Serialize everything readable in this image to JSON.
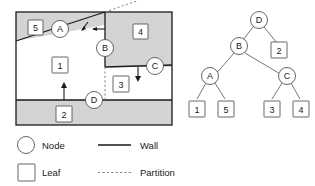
{
  "figure": {
    "colors": {
      "region_fill_gray": "#d4d4d4",
      "region_fill_white": "#ffffff",
      "wall_stroke": "#1a1a1a",
      "partition_stroke": "#777777",
      "shape_stroke": "#555555",
      "text": "#1a1a1a",
      "background": "#ffffff"
    }
  },
  "map": {
    "name": "partitioned-floorplan",
    "regions": [
      {
        "id": "region-5",
        "label": "5",
        "fill": "gray"
      },
      {
        "id": "region-4",
        "label": "4",
        "fill": "gray"
      },
      {
        "id": "region-2",
        "label": "2",
        "fill": "gray"
      },
      {
        "id": "region-1",
        "label": "1",
        "fill": "white"
      },
      {
        "id": "region-3",
        "label": "3",
        "fill": "white"
      }
    ],
    "nodes": [
      {
        "id": "map-node-a",
        "label": "A"
      },
      {
        "id": "map-node-b",
        "label": "B"
      },
      {
        "id": "map-node-c",
        "label": "C"
      },
      {
        "id": "map-node-d",
        "label": "D"
      }
    ],
    "leaf_labels": [
      "5",
      "4",
      "1",
      "3",
      "2"
    ]
  },
  "tree": {
    "name": "bsp-tree",
    "root": "D",
    "nodes": [
      {
        "id": "tree-node-d",
        "label": "D",
        "type": "node"
      },
      {
        "id": "tree-node-b",
        "label": "B",
        "type": "node"
      },
      {
        "id": "tree-node-a",
        "label": "A",
        "type": "node"
      },
      {
        "id": "tree-node-c",
        "label": "C",
        "type": "node"
      }
    ],
    "leaves": [
      {
        "id": "tree-leaf-2",
        "label": "2",
        "parent": "D"
      },
      {
        "id": "tree-leaf-1",
        "label": "1",
        "parent": "A"
      },
      {
        "id": "tree-leaf-5",
        "label": "5",
        "parent": "A"
      },
      {
        "id": "tree-leaf-3",
        "label": "3",
        "parent": "C"
      },
      {
        "id": "tree-leaf-4",
        "label": "4",
        "parent": "C"
      }
    ]
  },
  "legend": {
    "items": [
      {
        "id": "legend-node",
        "symbol": "circle-icon",
        "label": "Node"
      },
      {
        "id": "legend-wall",
        "symbol": "solid-line-icon",
        "label": "Wall"
      },
      {
        "id": "legend-leaf",
        "symbol": "square-icon",
        "label": "Leaf"
      },
      {
        "id": "legend-partition",
        "symbol": "dashed-line-icon",
        "label": "Partition"
      }
    ]
  }
}
